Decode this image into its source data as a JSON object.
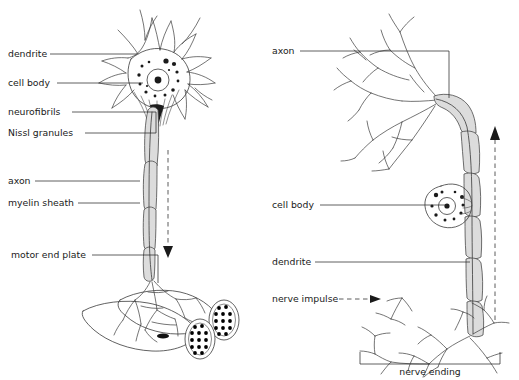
{
  "figure": {
    "background": "#ffffff",
    "ink": "#1a1a1a",
    "myelin_fill": "#dcdcdc"
  },
  "left_panel": {
    "name": "motor-neuron",
    "labels": [
      {
        "id": "dendrite",
        "text": "dendrite",
        "x": 8,
        "y": 57,
        "leader_x2": 137,
        "leader_y2": 57
      },
      {
        "id": "cell-body",
        "text": "cell body",
        "x": 8,
        "y": 86,
        "leader_x2": 143,
        "leader_y2": 86
      },
      {
        "id": "neurofibrils",
        "text": "neurofibrils",
        "x": 8,
        "y": 115,
        "leader_x2": 156,
        "leader_y2": 110
      },
      {
        "id": "nissl-granules",
        "text": "Nissl granules",
        "x": 8,
        "y": 136,
        "leader_x2": 150,
        "leader_y2": 133
      },
      {
        "id": "axon",
        "text": "axon",
        "x": 8,
        "y": 184,
        "leader_x2": 140,
        "leader_y2": 184
      },
      {
        "id": "myelin-sheath",
        "text": "myelin sheath",
        "x": 8,
        "y": 206,
        "leader_x2": 140,
        "leader_y2": 206
      },
      {
        "id": "motor-end-plate",
        "text": "motor end plate",
        "x": 11,
        "y": 258,
        "leader_x2": 121,
        "leader_y2": 258
      }
    ],
    "impulse_direction": "down"
  },
  "right_panel": {
    "name": "sensory-neuron",
    "labels": [
      {
        "id": "axon",
        "text": "axon",
        "x": 272,
        "y": 54,
        "leader_x2": 449,
        "leader_y2": 54
      },
      {
        "id": "cell-body",
        "text": "cell body",
        "x": 272,
        "y": 208,
        "leader_x2": 424,
        "leader_y2": 208
      },
      {
        "id": "dendrite",
        "text": "dendrite",
        "x": 272,
        "y": 265,
        "leader_x2": 455,
        "leader_y2": 265
      },
      {
        "id": "nerve-impulse",
        "text": "nerve impulse",
        "x": 272,
        "y": 302
      }
    ],
    "bracket_label": {
      "id": "nerve-ending",
      "text": "nerve ending",
      "cx": 430,
      "y": 372
    },
    "impulse_direction": "up"
  }
}
